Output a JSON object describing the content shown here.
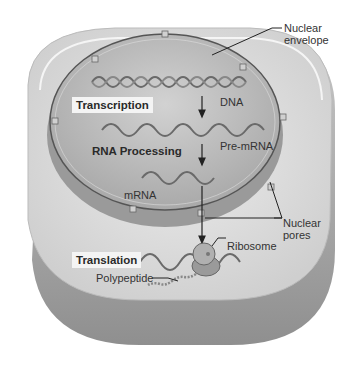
{
  "diagram": {
    "steps": [
      {
        "id": "transcription",
        "label": "Transcription"
      },
      {
        "id": "rna-processing",
        "label": "RNA Processing"
      },
      {
        "id": "translation",
        "label": "Translation"
      }
    ],
    "molecules": {
      "dna": "DNA",
      "pre_mrna": "Pre-mRNA",
      "mrna": "mRNA",
      "polypeptide": "Polypeptide"
    },
    "structures": {
      "nuclear_envelope": "Nuclear envelope",
      "nuclear_envelope_line1": "Nuclear",
      "nuclear_envelope_line2": "envelope",
      "nuclear_pores_line1": "Nuclear",
      "nuclear_pores_line2": "pores",
      "ribosome": "Ribosome"
    },
    "colors": {
      "cytoplasm": "#d9d9d9",
      "nucleus": "#b8b8b8",
      "envelope": "#555555",
      "strand": "#6a6a6a"
    }
  }
}
